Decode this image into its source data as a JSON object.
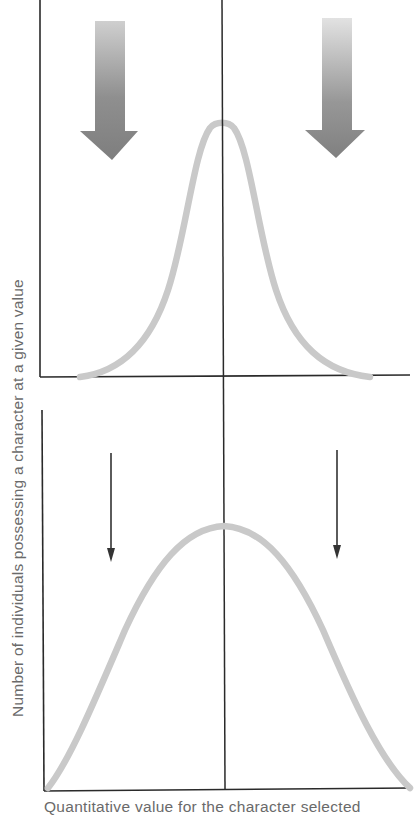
{
  "figure": {
    "type": "stabilizing-selection-diagram",
    "y_axis_label": "Number of individuals possessing a character at a given value",
    "x_axis_label": "Quantitative value for the character selected",
    "colors": {
      "axis": "#2a2a2a",
      "curve": "#c9c9c9",
      "thick_arrow_top": "#cfcfcf",
      "thick_arrow_bottom": "#7e7e7e",
      "thin_arrow": "#333333"
    },
    "panels": [
      {
        "name": "before-selection",
        "description": "Narrow, tall distribution with strong selection arrows on both tails",
        "arrows": [
          {
            "side": "left",
            "style": "thick-gradient"
          },
          {
            "side": "right",
            "style": "thick-gradient"
          }
        ],
        "curve": "narrow-bell"
      },
      {
        "name": "after-selection",
        "description": "Broader, lower distribution with weak selection arrows on both tails",
        "arrows": [
          {
            "side": "left",
            "style": "thin"
          },
          {
            "side": "right",
            "style": "thin"
          }
        ],
        "curve": "wide-bell"
      }
    ]
  }
}
